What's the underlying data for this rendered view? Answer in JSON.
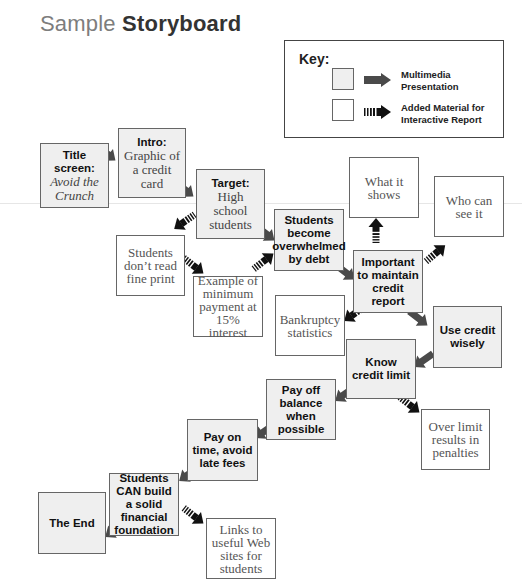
{
  "title": {
    "light": "Sample",
    "bold": "Storyboard"
  },
  "key": {
    "title": "Key:",
    "items": [
      {
        "type": "multimedia",
        "label_line1": "Multimedia",
        "label_line2": "Presentation"
      },
      {
        "type": "added",
        "label_line1": "Added Material for",
        "label_line2": "Interactive Report"
      }
    ]
  },
  "colors": {
    "multimedia_fill": "#efefef",
    "added_fill": "#ffffff",
    "arrow_solid": "#4a4a4a",
    "arrow_hatched": "#111111",
    "border": "#666666"
  },
  "boxes": {
    "title_screen": {
      "head": "Title screen:",
      "sub": "Avoid the Crunch"
    },
    "intro": {
      "head": "Intro:",
      "sub": "Graphic of a credit card"
    },
    "target": {
      "head": "Target:",
      "sub": "High school students"
    },
    "dont_read": {
      "text": "Students don’t read fine print"
    },
    "example": {
      "text": "Example of minimum payment at 15% interest"
    },
    "overwhelmed": {
      "text": "Students become overwhelmed by debt"
    },
    "what_it_shows": {
      "text": "What it shows"
    },
    "who_can_see": {
      "text": "Who can see it"
    },
    "important": {
      "text": "Important to maintain credit report"
    },
    "bankruptcy": {
      "text": "Bankruptcy statistics"
    },
    "use_credit": {
      "text": "Use credit wisely"
    },
    "know_limit": {
      "text": "Know credit limit"
    },
    "over_limit": {
      "text": "Over limit results in penalties"
    },
    "pay_off": {
      "text": "Pay off balance when possible"
    },
    "pay_on_time": {
      "text": "Pay on time, avoid late fees"
    },
    "can_build": {
      "text": "Students CAN build a solid financial foundation"
    },
    "the_end": {
      "text": "The End"
    },
    "links": {
      "text": "Links to useful Web sites for students"
    }
  }
}
